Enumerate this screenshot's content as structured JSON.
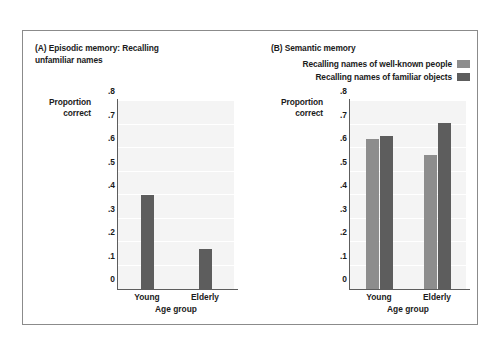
{
  "figure": {
    "frame_border_color": "#8b8b8b",
    "plot_bg_color": "#f4f4f4",
    "gridline_color": "#ffffff",
    "axis_color": "#5d5d5d",
    "text_color": "#1b1b1b"
  },
  "panel_a": {
    "title": "(A) Episodic memory: Recalling\n      unfamiliar names",
    "ylabel": "Proportion\ncorrect",
    "xlabel": "Age group",
    "yticks": [
      ".8",
      ".7",
      ".6",
      ".5",
      ".4",
      ".3",
      ".2",
      ".1",
      "0"
    ],
    "categories": [
      "Young",
      "Elderly"
    ]
  },
  "panel_b": {
    "title": "(B) Semantic memory",
    "ylabel": "Proportion\ncorrect",
    "xlabel": "Age group",
    "yticks": [
      ".8",
      ".7",
      ".6",
      ".5",
      ".4",
      ".3",
      ".2",
      ".1",
      "0"
    ],
    "categories": [
      "Young",
      "Elderly"
    ],
    "legend": [
      {
        "label": "Recalling names of well-known people",
        "color": "#8d8d8d"
      },
      {
        "label": "Recalling names of familiar objects",
        "color": "#5d5d5d"
      }
    ]
  },
  "chart_data": [
    {
      "type": "bar",
      "title": "(A) Episodic memory: Recalling unfamiliar names",
      "xlabel": "Age group",
      "ylabel": "Proportion correct",
      "categories": [
        "Young",
        "Elderly"
      ],
      "values": [
        0.4,
        0.17
      ],
      "ylim": [
        0,
        0.8
      ],
      "yticks": [
        0,
        0.1,
        0.2,
        0.3,
        0.4,
        0.5,
        0.6,
        0.7,
        0.8
      ],
      "grid": true,
      "legend": "none",
      "bar_color": "#5d5d5d"
    },
    {
      "type": "bar",
      "title": "(B) Semantic memory",
      "xlabel": "Age group",
      "ylabel": "Proportion correct",
      "categories": [
        "Young",
        "Elderly"
      ],
      "series": [
        {
          "name": "Recalling names of well-known people",
          "values": [
            0.64,
            0.57
          ],
          "color": "#8d8d8d"
        },
        {
          "name": "Recalling names of familiar objects",
          "values": [
            0.65,
            0.705
          ],
          "color": "#5d5d5d"
        }
      ],
      "ylim": [
        0,
        0.8
      ],
      "yticks": [
        0,
        0.1,
        0.2,
        0.3,
        0.4,
        0.5,
        0.6,
        0.7,
        0.8
      ],
      "grid": true,
      "legend": "top-right"
    }
  ]
}
